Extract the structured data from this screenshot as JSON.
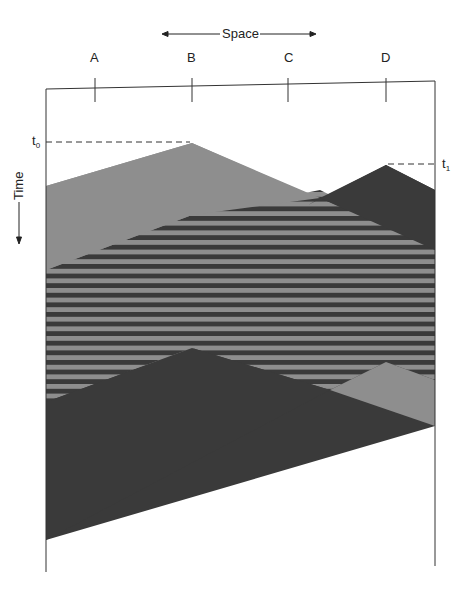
{
  "diagram": {
    "title_axis": {
      "space_label": "Space",
      "time_label": "Time"
    },
    "locations": [
      {
        "label": "A",
        "x": 95
      },
      {
        "label": "B",
        "x": 192
      },
      {
        "label": "C",
        "x": 288
      },
      {
        "label": "D",
        "x": 386
      }
    ],
    "time_markers": [
      {
        "label": "t",
        "sub": "0"
      },
      {
        "label": "t",
        "sub": "1"
      }
    ],
    "colors": {
      "light_region": "#8e8e8e",
      "dark_region": "#3a3a3a",
      "stripe_light": "#8e8e8e",
      "stripe_dark": "#3a3a3a",
      "frame": "#333333"
    }
  }
}
